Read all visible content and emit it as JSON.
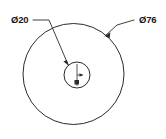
{
  "drawing": {
    "title": "Concentric circles dimensioned drawing",
    "background_color": "#ffffff",
    "line_color": "#2b2b2b",
    "units_note": "",
    "dimensions": [
      {
        "id": "outer-diameter",
        "label": "Ø76",
        "value": 76,
        "symbol": "Ø",
        "text_x": 139,
        "text_y": 23,
        "leader_points": "105,36 117,25 134,20",
        "arrow_points": "105,36 110.4,32.2 109.6,38.6",
        "target": "outer-circle"
      },
      {
        "id": "inner-diameter",
        "label": "Ø20",
        "value": 20,
        "symbol": "Ø",
        "text_x": 11,
        "text_y": 23,
        "leader_points": "68.5,65.5 49,20 33,20",
        "arrow_points": "68.5,65.5 63.4,61.6 66.9,59.9",
        "target": "inner-circle"
      }
    ],
    "circles": [
      {
        "id": "outer-circle",
        "name": "outer-circle",
        "cx": 73.5,
        "cy": 74,
        "r": 50.5,
        "diameter_label": "Ø76"
      },
      {
        "id": "inner-circle",
        "name": "inner-circle",
        "cx": 77,
        "cy": 75,
        "r": 13,
        "diameter_label": "Ø20"
      }
    ],
    "center_mark": {
      "id": "center-mark",
      "line_x": 77,
      "line_y1": 64,
      "line_y2": 86,
      "tick_y": 75,
      "tick_x2": 83,
      "block_x": 74.5,
      "block_y": 80,
      "block_w": 4.5,
      "block_h": 4.5
    }
  }
}
